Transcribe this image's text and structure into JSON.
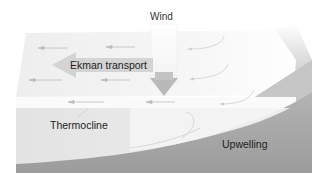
{
  "diagram": {
    "labels": {
      "wind": "Wind",
      "ekman_transport": "Ekman transport",
      "thermocline": "Thermocline",
      "upwelling": "Upwelling"
    },
    "elements": [
      {
        "name": "wind",
        "type": "downward-arrow",
        "direction": "down"
      },
      {
        "name": "ekman-transport",
        "type": "arrow",
        "direction": "left"
      },
      {
        "name": "surface-current-arrows",
        "type": "small-arrows",
        "direction": "left",
        "count": 8
      },
      {
        "name": "upwelling-flow-curves",
        "type": "curved-arrows",
        "count": 5
      },
      {
        "name": "ocean-surface",
        "type": "plane"
      },
      {
        "name": "thermocline-layer",
        "type": "region"
      },
      {
        "name": "deep-water",
        "type": "region"
      },
      {
        "name": "coastline-slope",
        "type": "region"
      }
    ],
    "colors": {
      "background": "#ffffff",
      "surface": "#ececec",
      "thermocline_layer": "#e0e0e0",
      "deep_water": "#a3a3a3",
      "coast": "#bdbdbd",
      "arrow": "#bdbdbd",
      "ekman_label_bg": "#d4d4d4"
    }
  }
}
